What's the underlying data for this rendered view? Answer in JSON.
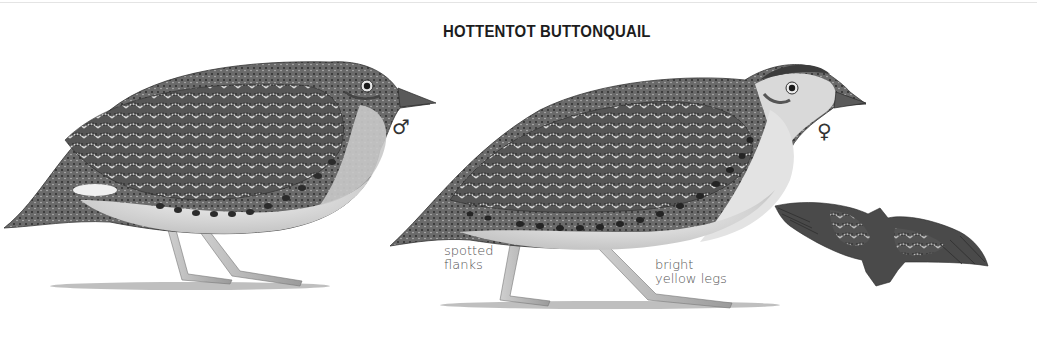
{
  "plate": {
    "title": "HOTTENTOT BUTTONQUAIL",
    "figures": [
      {
        "id": "male",
        "sex_symbol": "♂",
        "sex": "male",
        "pose": "standing, left-facing profile"
      },
      {
        "id": "female",
        "sex_symbol": "♀",
        "sex": "female",
        "pose": "walking, left-facing profile"
      },
      {
        "id": "flight",
        "pose": "in flight, viewed from above"
      }
    ],
    "annotations": [
      {
        "target": "female",
        "lines": [
          "spotted",
          "flanks"
        ]
      },
      {
        "target": "female",
        "lines": [
          "bright",
          "yellow legs"
        ]
      }
    ]
  },
  "colors": {
    "background": "#ffffff",
    "plumage_dark": "#3a3a3a",
    "plumage_mid": "#7a7a7a",
    "plumage_light": "#d4d4d4",
    "belly": "#ececec",
    "text": "#1d1d1d",
    "annotation_text": "#555555"
  }
}
